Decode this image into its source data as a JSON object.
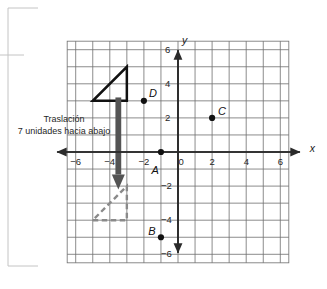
{
  "figure": {
    "kind": "coordinate-plane-translation-diagram",
    "annotation": {
      "line1": "Traslación",
      "line2": "7 unidades hacia abajo"
    },
    "axes": {
      "x_name": "x",
      "y_name": "y",
      "x_ticks": [
        "-6",
        "-4",
        "-2",
        "0",
        "2",
        "4",
        "6"
      ],
      "y_ticks": [
        "6",
        "4",
        "2",
        "-2",
        "-4",
        "-6"
      ],
      "origin_label": "0"
    },
    "point_labels": {
      "a": "A",
      "b": "B",
      "c": "C",
      "d": "D"
    }
  },
  "chart_data": {
    "type": "scatter",
    "title": "",
    "xlabel": "x",
    "ylabel": "y",
    "xlim": [
      -6.5,
      6.5
    ],
    "ylim": [
      -6.5,
      6.5
    ],
    "xticks": [
      -6,
      -4,
      -2,
      0,
      2,
      4,
      6
    ],
    "yticks": [
      6,
      4,
      2,
      -2,
      -4,
      -6
    ],
    "grid": true,
    "grid_step": 1,
    "legend": "none",
    "points": [
      {
        "label": "A",
        "x": -1,
        "y": 0,
        "label_dx": -0.55,
        "label_dy": 0.75
      },
      {
        "label": "B",
        "x": -1,
        "y": -5,
        "label_dx": -0.75,
        "label_dy": -0.65
      },
      {
        "label": "C",
        "x": 2,
        "y": 2,
        "label_dx": 0.35,
        "label_dy": -0.7
      },
      {
        "label": "D",
        "x": -2,
        "y": 3,
        "label_dx": 0.3,
        "label_dy": -0.75
      }
    ],
    "shapes": [
      {
        "name": "preimage-triangle",
        "style": "solid",
        "color": "#111111",
        "vertices": [
          [
            -5,
            3
          ],
          [
            -3,
            3
          ],
          [
            -3,
            5
          ]
        ]
      },
      {
        "name": "image-triangle",
        "style": "dashed",
        "color": "#8a8a8a",
        "vertices": [
          [
            -5,
            -4
          ],
          [
            -3,
            -4
          ],
          [
            -3,
            -2
          ]
        ]
      }
    ],
    "annotations": [
      {
        "name": "translation-arrow",
        "type": "arrow",
        "color": "#545454",
        "from": [
          -3.5,
          3.2
        ],
        "to": [
          -3.5,
          -2.2
        ],
        "text": "Traslación 7 unidades hacia abajo"
      }
    ]
  }
}
